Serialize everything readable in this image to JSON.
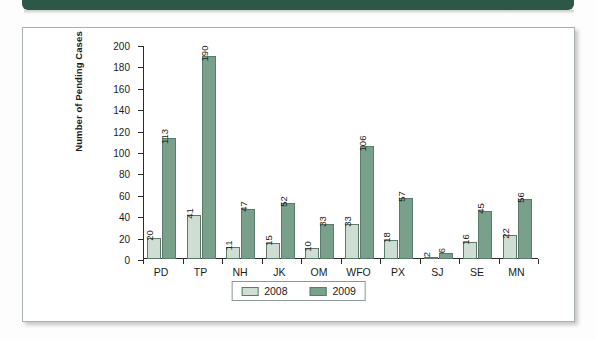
{
  "banner": {
    "color": "#2d5746"
  },
  "chart_data": {
    "type": "bar",
    "title": "",
    "xlabel": "",
    "ylabel": "Number of Pending Cases",
    "ylim": [
      0,
      200
    ],
    "ytick_step": 20,
    "yticks": [
      0,
      20,
      40,
      60,
      80,
      100,
      120,
      140,
      160,
      180,
      200
    ],
    "grid": false,
    "legend_position": "bottom-center",
    "categories": [
      "PD",
      "TP",
      "NH",
      "JK",
      "OM",
      "WFO",
      "PX",
      "SJ",
      "SE",
      "MN"
    ],
    "series": [
      {
        "name": "2008",
        "color": "#cfded2",
        "values": [
          20,
          41,
          11,
          15,
          10,
          33,
          18,
          2,
          16,
          22
        ]
      },
      {
        "name": "2009",
        "color": "#78a08b",
        "values": [
          113,
          190,
          47,
          52,
          33,
          106,
          57,
          6,
          45,
          56
        ]
      }
    ],
    "data_labels": true
  }
}
